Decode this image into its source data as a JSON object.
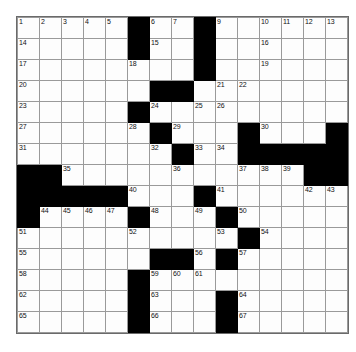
{
  "puzzle": {
    "kind": "crossword-grid",
    "rows": 15,
    "cols": 15,
    "colors": {
      "block": "#000000",
      "cell": "#fdfdfd",
      "gridline": "#9a9a9a",
      "number_text": "#111111",
      "page_background": "#ffffff"
    },
    "blocks": [
      [
        0,
        5
      ],
      [
        0,
        8
      ],
      [
        1,
        5
      ],
      [
        1,
        8
      ],
      [
        2,
        8
      ],
      [
        3,
        6
      ],
      [
        3,
        7
      ],
      [
        4,
        5
      ],
      [
        5,
        6
      ],
      [
        5,
        10
      ],
      [
        5,
        14
      ],
      [
        6,
        7
      ],
      [
        6,
        10
      ],
      [
        6,
        11
      ],
      [
        6,
        12
      ],
      [
        6,
        13
      ],
      [
        6,
        14
      ],
      [
        7,
        0
      ],
      [
        7,
        1
      ],
      [
        7,
        13
      ],
      [
        7,
        14
      ],
      [
        8,
        0
      ],
      [
        8,
        1
      ],
      [
        8,
        2
      ],
      [
        8,
        3
      ],
      [
        8,
        4
      ],
      [
        8,
        8
      ],
      [
        9,
        0
      ],
      [
        9,
        5
      ],
      [
        9,
        9
      ],
      [
        10,
        10
      ],
      [
        11,
        6
      ],
      [
        11,
        7
      ],
      [
        11,
        9
      ],
      [
        12,
        5
      ],
      [
        13,
        5
      ],
      [
        13,
        9
      ],
      [
        14,
        5
      ],
      [
        14,
        9
      ]
    ],
    "numbers": [
      {
        "row": 0,
        "col": 0,
        "label": "1"
      },
      {
        "row": 0,
        "col": 1,
        "label": "2"
      },
      {
        "row": 0,
        "col": 2,
        "label": "3"
      },
      {
        "row": 0,
        "col": 3,
        "label": "4"
      },
      {
        "row": 0,
        "col": 4,
        "label": "5"
      },
      {
        "row": 0,
        "col": 6,
        "label": "6"
      },
      {
        "row": 0,
        "col": 7,
        "label": "7"
      },
      {
        "row": 0,
        "col": 8,
        "label": "8"
      },
      {
        "row": 0,
        "col": 9,
        "label": "9"
      },
      {
        "row": 0,
        "col": 11,
        "label": "10"
      },
      {
        "row": 0,
        "col": 12,
        "label": "11"
      },
      {
        "row": 0,
        "col": 13,
        "label": "12"
      },
      {
        "row": 0,
        "col": 14,
        "label": "13"
      },
      {
        "row": 1,
        "col": 0,
        "label": "14"
      },
      {
        "row": 1,
        "col": 6,
        "label": "15"
      },
      {
        "row": 1,
        "col": 11,
        "label": "16"
      },
      {
        "row": 2,
        "col": 0,
        "label": "17"
      },
      {
        "row": 2,
        "col": 5,
        "label": "18"
      },
      {
        "row": 2,
        "col": 11,
        "label": "19"
      },
      {
        "row": 3,
        "col": 0,
        "label": "20"
      },
      {
        "row": 3,
        "col": 9,
        "label": "21"
      },
      {
        "row": 3,
        "col": 10,
        "label": "22"
      },
      {
        "row": 4,
        "col": 0,
        "label": "23"
      },
      {
        "row": 4,
        "col": 6,
        "label": "24"
      },
      {
        "row": 4,
        "col": 8,
        "label": "25"
      },
      {
        "row": 4,
        "col": 9,
        "label": "26"
      },
      {
        "row": 5,
        "col": 0,
        "label": "27"
      },
      {
        "row": 5,
        "col": 5,
        "label": "28"
      },
      {
        "row": 5,
        "col": 7,
        "label": "29"
      },
      {
        "row": 5,
        "col": 11,
        "label": "30"
      },
      {
        "row": 6,
        "col": 0,
        "label": "31"
      },
      {
        "row": 6,
        "col": 6,
        "label": "32"
      },
      {
        "row": 6,
        "col": 8,
        "label": "33"
      },
      {
        "row": 6,
        "col": 9,
        "label": "34"
      },
      {
        "row": 7,
        "col": 2,
        "label": "35"
      },
      {
        "row": 7,
        "col": 7,
        "label": "36"
      },
      {
        "row": 7,
        "col": 10,
        "label": "37"
      },
      {
        "row": 7,
        "col": 11,
        "label": "38"
      },
      {
        "row": 7,
        "col": 12,
        "label": "39"
      },
      {
        "row": 8,
        "col": 5,
        "label": "40"
      },
      {
        "row": 8,
        "col": 9,
        "label": "41"
      },
      {
        "row": 8,
        "col": 13,
        "label": "42"
      },
      {
        "row": 8,
        "col": 14,
        "label": "43"
      },
      {
        "row": 9,
        "col": 1,
        "label": "44"
      },
      {
        "row": 9,
        "col": 2,
        "label": "45"
      },
      {
        "row": 9,
        "col": 3,
        "label": "46"
      },
      {
        "row": 9,
        "col": 4,
        "label": "47"
      },
      {
        "row": 9,
        "col": 6,
        "label": "48"
      },
      {
        "row": 9,
        "col": 8,
        "label": "49"
      },
      {
        "row": 9,
        "col": 10,
        "label": "50"
      },
      {
        "row": 10,
        "col": 0,
        "label": "51"
      },
      {
        "row": 10,
        "col": 5,
        "label": "52"
      },
      {
        "row": 10,
        "col": 9,
        "label": "53"
      },
      {
        "row": 10,
        "col": 11,
        "label": "54"
      },
      {
        "row": 11,
        "col": 0,
        "label": "55"
      },
      {
        "row": 11,
        "col": 8,
        "label": "56"
      },
      {
        "row": 11,
        "col": 10,
        "label": "57"
      },
      {
        "row": 12,
        "col": 0,
        "label": "58"
      },
      {
        "row": 12,
        "col": 6,
        "label": "59"
      },
      {
        "row": 12,
        "col": 7,
        "label": "60"
      },
      {
        "row": 12,
        "col": 8,
        "label": "61"
      },
      {
        "row": 13,
        "col": 0,
        "label": "62"
      },
      {
        "row": 13,
        "col": 6,
        "label": "63"
      },
      {
        "row": 13,
        "col": 10,
        "label": "64"
      },
      {
        "row": 14,
        "col": 0,
        "label": "65"
      },
      {
        "row": 14,
        "col": 6,
        "label": "66"
      },
      {
        "row": 14,
        "col": 10,
        "label": "67"
      }
    ]
  }
}
